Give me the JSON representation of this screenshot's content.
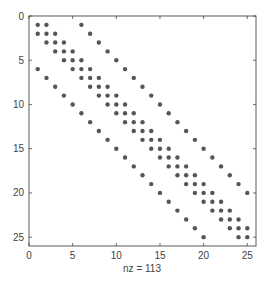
{
  "chart_data": {
    "type": "scatter",
    "subtype": "sparsity-pattern",
    "title": "",
    "xlabel": "nz = 113",
    "ylabel": "",
    "matrix_size": [
      25,
      25
    ],
    "nonzero_diagonals": [
      -5,
      -1,
      0,
      1,
      5
    ],
    "nz": 113,
    "xlim": [
      0,
      26
    ],
    "ylim": [
      26,
      0
    ],
    "xticks": [
      0,
      5,
      10,
      15,
      20,
      25
    ],
    "yticks": [
      0,
      5,
      10,
      15,
      20,
      25
    ],
    "grid": false,
    "marker_color": "#555555"
  }
}
